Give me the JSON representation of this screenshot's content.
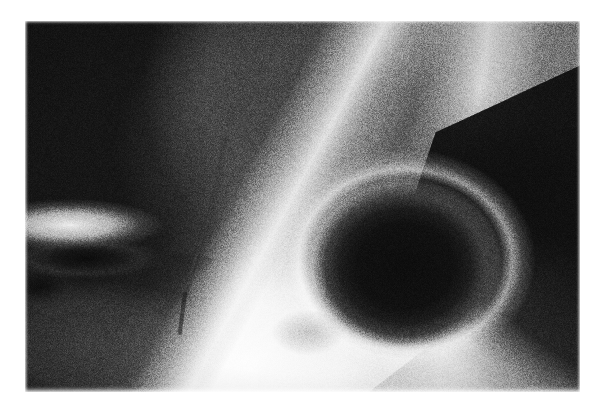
{
  "viewer": {
    "background_color": "#ffffff",
    "media_type": "grayscale-radiograph",
    "alt_text": "Grayscale radiograph showing a rounded dark foramen bordered by a bright bone cortex, with a large dark soft-tissue field in the upper left and a bright vertical cortical band in the upper right."
  },
  "radiograph": {
    "frame": {
      "left_px": 25,
      "top_px": 21,
      "width_px": 555,
      "height_px": 371
    },
    "palette": {
      "film_black": "#101010",
      "shadow_gray": "#3d3d3d",
      "mid_gray": "#8a8a8a",
      "bone_light": "#e8e8e8",
      "highlight_white": "#fdfdfd",
      "page_white": "#ffffff"
    },
    "regions": [
      {
        "id": "dark-field-upper-left",
        "label": "Dark soft-tissue / air field",
        "tone": "#141414",
        "position": "upper-left"
      },
      {
        "id": "cortical-ridge-diagonal",
        "label": "Bright cortical ridge",
        "tone": "#fdfdfd",
        "position": "diagonal from top-centre to mid-left"
      },
      {
        "id": "ilium-body-mass",
        "label": "Mid-grey bone mass",
        "tone": "#4e4e4e",
        "position": "upper-right of centre"
      },
      {
        "id": "vertical-cortical-band",
        "label": "Bright vertical cortical band",
        "tone": "#f2f2f2",
        "position": "upper-right"
      },
      {
        "id": "foramen-cavity",
        "label": "Rounded radiolucent foramen",
        "tone": "#0d0d0d",
        "position": "lower-right of centre"
      },
      {
        "id": "foramen-rim",
        "label": "Bright rim of foramen",
        "tone": "#f0f0f0",
        "position": "lower-left margin of the foramen"
      },
      {
        "id": "dark-wedge-lower-right",
        "label": "Dark wedge",
        "tone": "#0e0e0e",
        "position": "lower-right"
      },
      {
        "id": "bright-tissue-lower-right-corner",
        "label": "Bright tissue",
        "tone": "#f0f0f0",
        "position": "bottom-right corner"
      },
      {
        "id": "left-horn-structure",
        "label": "Bright horn-shaped process",
        "tone": "#fbfbfb",
        "position": "mid-left edge"
      },
      {
        "id": "horn-notch",
        "label": "Dark notch beneath the horn",
        "tone": "#0a0a0a",
        "position": "below mid-left process"
      },
      {
        "id": "fissure-line",
        "label": "Thin dark fissure line",
        "tone": "#6f6f6f",
        "position": "lower-centre over bright tissue"
      },
      {
        "id": "faint-blob",
        "label": "Faint grey opacity",
        "tone": "#8c8c8c",
        "position": "lower-centre"
      }
    ],
    "grain": {
      "label": "film-grain",
      "intensity_percent": 30
    }
  }
}
